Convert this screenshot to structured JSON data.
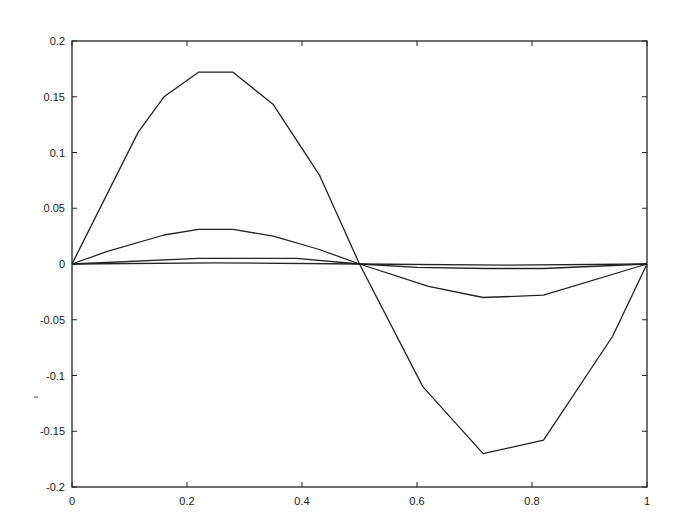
{
  "chart_data": {
    "type": "line",
    "title": "",
    "xlabel": "",
    "ylabel": "",
    "xlim": [
      0,
      1
    ],
    "ylim": [
      -0.2,
      0.2
    ],
    "grid": false,
    "legend": null,
    "x_ticks": [
      "0",
      "0.2",
      "0.4",
      "0.6",
      "0.8",
      "1"
    ],
    "x_tick_values": [
      0,
      0.2,
      0.4,
      0.6,
      0.8,
      1
    ],
    "y_ticks": [
      "0.2",
      "0.15",
      "0.1",
      "0.05",
      "0",
      "-0.05",
      "-0.1",
      "-0.15",
      "-0.2"
    ],
    "y_tick_values": [
      0.2,
      0.15,
      0.1,
      0.05,
      0,
      -0.05,
      -0.1,
      -0.15,
      -0.2
    ],
    "line_color": "#222222",
    "series": [
      {
        "name": "mode-1",
        "x": [
          0,
          0.115,
          0.16,
          0.22,
          0.28,
          0.35,
          0.43,
          0.5,
          0.61,
          0.715,
          0.82,
          0.94,
          1.0
        ],
        "y": [
          0,
          0.118,
          0.15,
          0.172,
          0.172,
          0.143,
          0.08,
          0,
          -0.11,
          -0.17,
          -0.158,
          -0.065,
          0
        ]
      },
      {
        "name": "mode-2",
        "x": [
          0,
          0.06,
          0.16,
          0.22,
          0.28,
          0.35,
          0.43,
          0.5,
          0.62,
          0.715,
          0.82,
          1.0
        ],
        "y": [
          0,
          0.011,
          0.026,
          0.031,
          0.031,
          0.025,
          0.013,
          0,
          -0.02,
          -0.03,
          -0.028,
          0
        ]
      },
      {
        "name": "mode-3",
        "x": [
          0,
          0.22,
          0.39,
          0.5,
          0.6,
          0.72,
          0.82,
          1.0
        ],
        "y": [
          0,
          0.005,
          0.005,
          0,
          -0.003,
          -0.004,
          -0.004,
          0
        ]
      },
      {
        "name": "mode-4",
        "x": [
          0,
          0.25,
          0.5,
          0.75,
          1.0
        ],
        "y": [
          0,
          0.001,
          0,
          -0.001,
          0
        ]
      }
    ]
  }
}
